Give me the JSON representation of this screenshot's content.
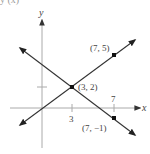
{
  "caption_fragment": "y (x)",
  "axes": {
    "x_label": "x",
    "y_label": "y",
    "x_ticks": [
      {
        "value": 3,
        "label": "3"
      },
      {
        "value": 7,
        "label": "7"
      }
    ],
    "y_ticks": [
      {
        "value": 2,
        "label": ""
      }
    ],
    "axis_color": "#999999"
  },
  "lines": [
    {
      "name": "line-through-origin",
      "points": [
        [
          0,
          0
        ],
        [
          3,
          2
        ],
        [
          7,
          5
        ]
      ],
      "color": "#333333"
    },
    {
      "name": "line-decreasing",
      "points": [
        [
          3,
          2
        ],
        [
          7,
          -1
        ]
      ],
      "color": "#333333"
    }
  ],
  "points": [
    {
      "label": "(3, 2)",
      "x": 3,
      "y": 2
    },
    {
      "label": "(7, 5)",
      "x": 7,
      "y": 5
    },
    {
      "label": "(7, −1)",
      "x": 7,
      "y": -1
    }
  ]
}
